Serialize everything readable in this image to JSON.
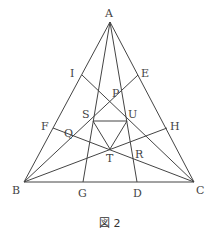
{
  "caption": "図 2",
  "colors": {
    "line": "#444444",
    "text": "#444444",
    "background": "#ffffff"
  },
  "points": {
    "A": {
      "label": "A",
      "x": 110,
      "y": 22
    },
    "B": {
      "label": "B",
      "x": 24,
      "y": 182
    },
    "C": {
      "label": "C",
      "x": 194,
      "y": 182
    },
    "I": {
      "label": "I",
      "x": 82,
      "y": 75
    },
    "E": {
      "label": "E",
      "x": 138,
      "y": 75
    },
    "F": {
      "label": "F",
      "x": 53,
      "y": 128
    },
    "H": {
      "label": "H",
      "x": 167,
      "y": 128
    },
    "G": {
      "label": "G",
      "x": 83,
      "y": 182
    },
    "D": {
      "label": "D",
      "x": 137,
      "y": 182
    },
    "S": {
      "label": "S",
      "x": 93,
      "y": 121
    },
    "U": {
      "label": "U",
      "x": 127,
      "y": 121
    },
    "T": {
      "label": "T",
      "x": 110,
      "y": 149
    },
    "P": {
      "label": "P",
      "x": 110,
      "y": 109
    },
    "Q": {
      "label": "Q",
      "x": 71,
      "y": 140
    },
    "R": {
      "label": "R",
      "x": 134,
      "y": 159
    }
  },
  "labels": {
    "A": "A",
    "B": "B",
    "C": "C",
    "D": "D",
    "E": "E",
    "F": "F",
    "G": "G",
    "H": "H",
    "I": "I",
    "P": "P",
    "Q": "Q",
    "R": "R",
    "S": "S",
    "T": "T",
    "U": "U"
  },
  "segments": [
    [
      "A",
      "B"
    ],
    [
      "B",
      "C"
    ],
    [
      "C",
      "A"
    ],
    [
      "A",
      "G"
    ],
    [
      "A",
      "D"
    ],
    [
      "B",
      "E"
    ],
    [
      "B",
      "H"
    ],
    [
      "C",
      "I"
    ],
    [
      "C",
      "F"
    ],
    [
      "S",
      "U"
    ],
    [
      "U",
      "T"
    ],
    [
      "T",
      "S"
    ]
  ]
}
